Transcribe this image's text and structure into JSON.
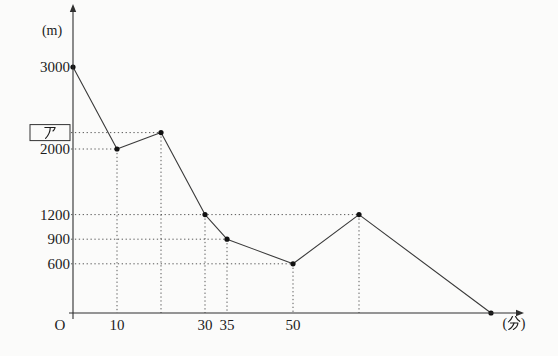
{
  "colors": {
    "background": "#fbfbfa",
    "axis": "#2f2f2f",
    "line": "#3a3a3a",
    "dot": "#111111",
    "guide": "#454545",
    "text": "#1c1c1c",
    "box_border": "#333333"
  },
  "chart_data": {
    "type": "line",
    "title": "",
    "xlabel": "(分)",
    "ylabel": "(m)",
    "origin_label": "O",
    "x": [
      0,
      10,
      20,
      30,
      35,
      50,
      65,
      95
    ],
    "y": [
      3000,
      2000,
      2200,
      1200,
      900,
      600,
      1200,
      0
    ],
    "xlim": [
      0,
      100
    ],
    "ylim": [
      0,
      3300
    ],
    "legend": "none",
    "grid": "dotted guide lines only",
    "x_tick_labels": [
      {
        "value": 10,
        "label": "10"
      },
      {
        "value": 30,
        "label": "30"
      },
      {
        "value": 35,
        "label": "35"
      },
      {
        "value": 50,
        "label": "50"
      }
    ],
    "y_tick_labels": [
      {
        "value": 3000,
        "label": "3000",
        "boxed": false
      },
      {
        "value": 2200,
        "label": "ア",
        "boxed": true
      },
      {
        "value": 2000,
        "label": "2000",
        "boxed": false
      },
      {
        "value": 1200,
        "label": "1200",
        "boxed": false
      },
      {
        "value": 900,
        "label": "900",
        "boxed": false
      },
      {
        "value": 600,
        "label": "600",
        "boxed": false
      }
    ],
    "unknown_point": {
      "x": 20,
      "label": "ア",
      "approx_y": 2200
    },
    "guide_lines": {
      "horizontal": [
        {
          "y": 2200,
          "to_x": 20
        },
        {
          "y": 2000,
          "to_x": 10
        },
        {
          "y": 1200,
          "to_x": 65
        },
        {
          "y": 900,
          "to_x": 35
        },
        {
          "y": 600,
          "to_x": 50
        }
      ],
      "vertical": [
        {
          "x": 10,
          "from_y": 2000
        },
        {
          "x": 20,
          "from_y": 2200
        },
        {
          "x": 30,
          "from_y": 1200
        },
        {
          "x": 35,
          "from_y": 900
        },
        {
          "x": 50,
          "from_y": 600
        },
        {
          "x": 65,
          "from_y": 1200
        }
      ]
    }
  }
}
